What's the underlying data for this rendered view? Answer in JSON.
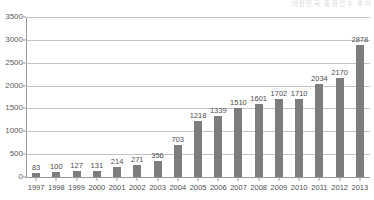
{
  "corner_note": {
    "text": "대한민국 출원건수 추이"
  },
  "chart_data": {
    "type": "bar",
    "title": "",
    "subtitle": "",
    "xlabel": "",
    "ylabel": "",
    "categories": [
      "1997",
      "1998",
      "1999",
      "2000",
      "2001",
      "2002",
      "2003",
      "2004",
      "2005",
      "2006",
      "2007",
      "2008",
      "2009",
      "2010",
      "2011",
      "2012",
      "2013"
    ],
    "values": [
      83,
      100,
      127,
      131,
      214,
      271,
      356,
      703,
      1218,
      1339,
      1510,
      1601,
      1702,
      1710,
      2034,
      2170,
      2878
    ],
    "data_labels": [
      "83",
      "100",
      "127",
      "131",
      "214",
      "271",
      "356",
      "703",
      "1218",
      "1339",
      "1510",
      "1601",
      "1702",
      "1710",
      "2034",
      "2170",
      "2878"
    ],
    "ylim": [
      0,
      3500
    ],
    "ytick_values": [
      0,
      500,
      1000,
      1500,
      2000,
      2500,
      3000,
      3500
    ],
    "ytick_labels": [
      "0",
      "500",
      "1000",
      "1500",
      "2000",
      "2500",
      "3000",
      "3500"
    ],
    "grid": true,
    "legend": false,
    "legend_position": "none",
    "series": [
      {
        "name": "",
        "values": [
          83,
          100,
          127,
          131,
          214,
          271,
          356,
          703,
          1218,
          1339,
          1510,
          1601,
          1702,
          1710,
          2034,
          2170,
          2878
        ]
      }
    ],
    "colors": {
      "bar": "#7d7d7d",
      "gridline": "#c3c3c3",
      "axis": "#9a9a9a",
      "label_text": "#4d4d4f",
      "tick_text": "#59595b",
      "background": "#ffffff"
    }
  }
}
